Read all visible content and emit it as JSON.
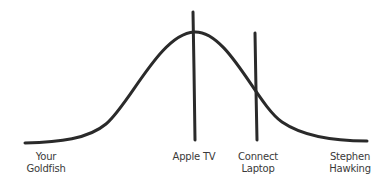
{
  "diagram": {
    "type": "bell-curve",
    "stroke_color": "#2a2a2a",
    "label_color": "#3a3a3a",
    "markers": [
      {
        "label_line1": "Apple",
        "label_line2": "TV",
        "full": "Apple TV"
      },
      {
        "label_line1": "Connect",
        "label_line2": "Laptop",
        "full": "Connect Laptop"
      }
    ],
    "axis_labels": {
      "left": {
        "line1": "Your",
        "line2": "Goldfish"
      },
      "center": {
        "line1": "Apple TV"
      },
      "right_marker": {
        "line1": "Connect",
        "line2": "Laptop"
      },
      "right": {
        "line1": "Stephen",
        "line2": "Hawking"
      }
    }
  }
}
